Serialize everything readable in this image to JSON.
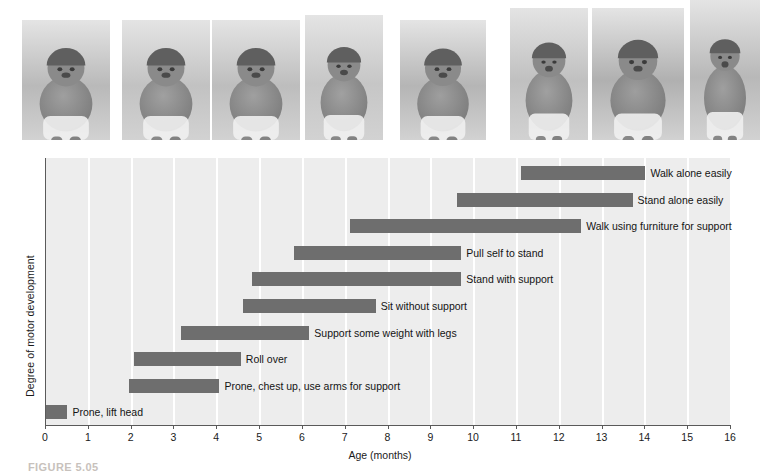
{
  "figure": {
    "caption": "FIGURE 5.05",
    "photo_strip": {
      "name": "infant-motor-development-photos",
      "count": 8,
      "photos": [
        {
          "name": "photo-prone-lift-head",
          "alt": "infant lying prone lifting head",
          "x": 22,
          "w": 88,
          "h": 120,
          "tone": "#b9b9b9"
        },
        {
          "name": "photo-roll-over",
          "alt": "infant rolling over",
          "x": 122,
          "w": 88,
          "h": 120,
          "tone": "#c2c2c2"
        },
        {
          "name": "photo-crawl",
          "alt": "infant on hands and feet",
          "x": 212,
          "w": 88,
          "h": 120,
          "tone": "#bdbdbd"
        },
        {
          "name": "photo-sit-without-support",
          "alt": "infant sitting without support",
          "x": 305,
          "w": 78,
          "h": 125,
          "tone": "#c6c6c6"
        },
        {
          "name": "photo-pull-self-to-stand",
          "alt": "infant pulling self up on a box",
          "x": 400,
          "w": 86,
          "h": 120,
          "tone": "#b5b5b5"
        },
        {
          "name": "photo-stand-with-support",
          "alt": "infant standing holding furniture",
          "x": 510,
          "w": 78,
          "h": 132,
          "tone": "#c0c0c0"
        },
        {
          "name": "photo-walk-with-support",
          "alt": "infant walking held by adult hands",
          "x": 592,
          "w": 92,
          "h": 132,
          "tone": "#b0b0b0"
        },
        {
          "name": "photo-walk-alone",
          "alt": "toddler walking alone",
          "x": 690,
          "w": 70,
          "h": 140,
          "tone": "#b8b8b8"
        }
      ]
    }
  },
  "chart_data": {
    "type": "bar",
    "orientation": "horizontal",
    "subtype": "range-bar",
    "title": "",
    "xlabel": "Age (months)",
    "ylabel": "Degree of motor development",
    "xlim": [
      0,
      16
    ],
    "xticks": [
      0,
      1,
      2,
      3,
      4,
      5,
      6,
      7,
      8,
      9,
      10,
      11,
      12,
      13,
      14,
      15,
      16
    ],
    "xtick_labels": [
      "0",
      "1",
      "2",
      "3",
      "4",
      "5",
      "6",
      "7",
      "8",
      "9",
      "10",
      "11",
      "12",
      "13",
      "14",
      "15",
      "16"
    ],
    "grid": "vertical",
    "legend": "none",
    "bar_color": "#6e6e6e",
    "plot_background": "#ededed",
    "categories": [
      "Walk alone easily",
      "Stand alone easily",
      "Walk using furniture for support",
      "Pull self to stand",
      "Stand with support",
      "Sit without support",
      "Support some weight with legs",
      "Roll over",
      "Prone, chest up, use arms for support",
      "Prone, lift head"
    ],
    "bars": [
      {
        "label": "Walk alone easily",
        "start": 11.1,
        "end": 14.0
      },
      {
        "label": "Stand alone easily",
        "start": 9.6,
        "end": 13.7
      },
      {
        "label": "Walk using furniture for support",
        "start": 7.1,
        "end": 12.5
      },
      {
        "label": "Pull self to stand",
        "start": 5.8,
        "end": 9.7
      },
      {
        "label": "Stand with support",
        "start": 4.8,
        "end": 9.7
      },
      {
        "label": "Sit without support",
        "start": 4.6,
        "end": 7.7
      },
      {
        "label": "Support some weight with legs",
        "start": 3.15,
        "end": 6.15
      },
      {
        "label": "Roll over",
        "start": 2.05,
        "end": 4.55
      },
      {
        "label": "Prone, chest up, use arms for support",
        "start": 1.95,
        "end": 4.05
      },
      {
        "label": "Prone, lift head",
        "start": 0.0,
        "end": 0.5
      }
    ]
  }
}
